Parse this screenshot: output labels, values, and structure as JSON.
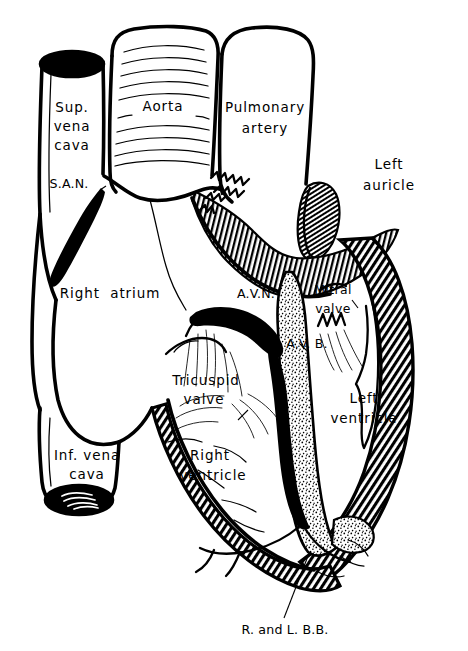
{
  "figure": {
    "style": "black-and-white pen-and-ink line drawing, coronal cut-away section",
    "background_color": "#ffffff",
    "ink_color": "#000000",
    "width": 468,
    "height": 651
  },
  "labels": {
    "sup_vena_cava": {
      "line1": "Sup.",
      "line2": "vena",
      "line3": "cava"
    },
    "aorta": "Aorta",
    "pulmonary_artery": {
      "line1": "Pulmonary",
      "line2": "artery"
    },
    "left_auricle": {
      "line1": "Left",
      "line2": "auricle"
    },
    "san": "S.A.N.",
    "right_atrium": "Right  atrium",
    "avn": "A.V.N.",
    "avb": "A.V. B.",
    "mitral_valve": {
      "line1": "Mitral",
      "line2": "valve"
    },
    "tricuspid_valve": {
      "line1": "Tricuspid",
      "line2": "valve"
    },
    "right_ventricle": {
      "line1": "Right",
      "line2": "ventricle"
    },
    "left_ventricle": {
      "line1": "Left",
      "line2": "ventricle"
    },
    "inf_vena_cava": {
      "line1": "Inf. vena",
      "line2": "cava"
    },
    "bundle_branches": "R. and L. B.B."
  },
  "structures": [
    {
      "name": "superior-vena-cava",
      "kind": "vessel",
      "shading": "outline",
      "label_key": "sup_vena_cava"
    },
    {
      "name": "aorta",
      "kind": "vessel",
      "shading": "horizontal-striation",
      "label_key": "aorta"
    },
    {
      "name": "pulmonary-artery",
      "kind": "vessel",
      "shading": "outline",
      "label_key": "pulmonary_artery"
    },
    {
      "name": "left-auricle",
      "kind": "chamber-appendage",
      "shading": "fine-hatch",
      "label_key": "left_auricle"
    },
    {
      "name": "sinoatrial-node",
      "kind": "conduction-node",
      "shading": "solid-black",
      "label_key": "san"
    },
    {
      "name": "right-atrium",
      "kind": "chamber",
      "shading": "outline",
      "label_key": "right_atrium"
    },
    {
      "name": "atrioventricular-node",
      "kind": "conduction-node",
      "shading": "solid-black",
      "label_key": "avn"
    },
    {
      "name": "atrioventricular-bundle",
      "kind": "conduction-tract",
      "shading": "solid-black",
      "label_key": "avb"
    },
    {
      "name": "mitral-valve",
      "kind": "valve",
      "shading": "outline",
      "label_key": "mitral_valve"
    },
    {
      "name": "tricuspid-valve",
      "kind": "valve",
      "shading": "outline",
      "label_key": "tricuspid_valve"
    },
    {
      "name": "right-ventricle",
      "kind": "chamber",
      "shading": "outline",
      "label_key": "right_ventricle"
    },
    {
      "name": "left-ventricle",
      "kind": "chamber",
      "shading": "diagonal-hatch-wall",
      "label_key": "left_ventricle"
    },
    {
      "name": "interventricular-septum",
      "kind": "septum",
      "shading": "stipple",
      "label_key": null
    },
    {
      "name": "inferior-vena-cava",
      "kind": "vessel",
      "shading": "outline",
      "label_key": "inf_vena_cava"
    },
    {
      "name": "bundle-branches",
      "kind": "conduction-tract",
      "shading": "line",
      "label_key": "bundle_branches"
    }
  ]
}
